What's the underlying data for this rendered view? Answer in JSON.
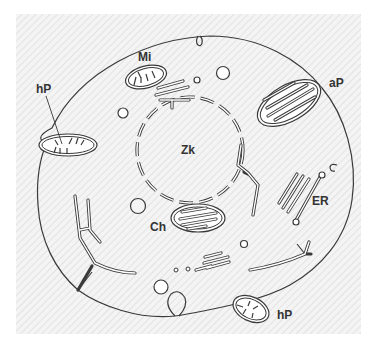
{
  "figure": {
    "type": "cell-diagram",
    "labels": {
      "nucleus": "Zk",
      "mitochondrion": "Mi",
      "amyloplast_top_left": "hP",
      "chloroplast_top_right": "aP",
      "endoplasmic_reticulum": "ER",
      "chloroplast_center": "Ch",
      "amyloplast_bottom_right": "hP"
    },
    "colors": {
      "background_hatch": "#e6e6e6",
      "line": "#3a3a3a",
      "cell_fill": "#ffffff",
      "label": "#333333"
    }
  }
}
